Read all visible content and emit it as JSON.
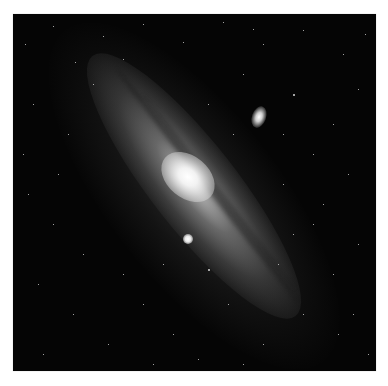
{
  "image": {
    "subject": "spiral galaxy with two satellite galaxies against a star field",
    "background_color": "#050505",
    "page_background": "#ffffff"
  },
  "stars": [
    [
      12,
      30,
      1
    ],
    [
      40,
      12,
      1
    ],
    [
      62,
      48,
      1
    ],
    [
      90,
      22,
      1
    ],
    [
      130,
      10,
      1
    ],
    [
      170,
      28,
      1
    ],
    [
      210,
      8,
      1
    ],
    [
      250,
      30,
      1
    ],
    [
      290,
      16,
      1
    ],
    [
      330,
      40,
      1
    ],
    [
      352,
      20,
      1
    ],
    [
      20,
      90,
      1
    ],
    [
      55,
      120,
      1
    ],
    [
      80,
      70,
      1
    ],
    [
      230,
      60,
      1
    ],
    [
      280,
      80,
      2
    ],
    [
      320,
      110,
      1
    ],
    [
      345,
      75,
      1
    ],
    [
      300,
      140,
      1
    ],
    [
      270,
      170,
      1
    ],
    [
      335,
      160,
      1
    ],
    [
      15,
      180,
      1
    ],
    [
      40,
      210,
      1
    ],
    [
      70,
      240,
      1
    ],
    [
      25,
      270,
      1
    ],
    [
      60,
      300,
      1
    ],
    [
      95,
      330,
      1
    ],
    [
      130,
      290,
      1
    ],
    [
      160,
      320,
      1
    ],
    [
      30,
      340,
      1
    ],
    [
      195,
      255,
      2
    ],
    [
      215,
      290,
      1
    ],
    [
      250,
      330,
      1
    ],
    [
      290,
      300,
      1
    ],
    [
      320,
      260,
      1
    ],
    [
      345,
      230,
      1
    ],
    [
      300,
      210,
      1
    ],
    [
      340,
      300,
      1
    ],
    [
      355,
      340,
      1
    ],
    [
      110,
      260,
      1
    ],
    [
      140,
      350,
      1
    ],
    [
      185,
      345,
      1
    ],
    [
      230,
      350,
      1
    ],
    [
      265,
      250,
      1
    ],
    [
      280,
      220,
      1
    ],
    [
      310,
      190,
      1
    ],
    [
      240,
      15,
      1
    ],
    [
      110,
      45,
      1
    ],
    [
      10,
      140,
      1
    ],
    [
      45,
      160,
      1
    ],
    [
      220,
      120,
      1
    ],
    [
      195,
      90,
      1
    ],
    [
      150,
      250,
      1
    ],
    [
      270,
      120,
      1
    ],
    [
      325,
      320,
      1
    ]
  ]
}
